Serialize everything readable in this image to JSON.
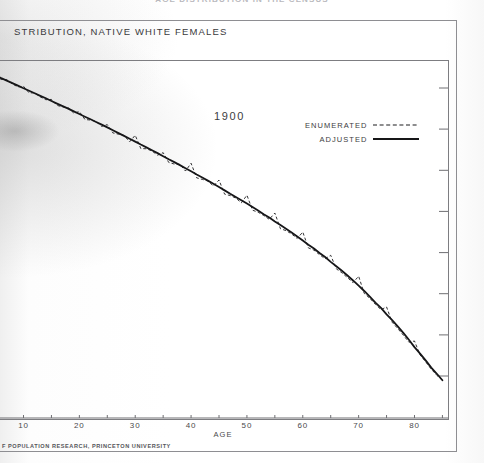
{
  "page": {
    "running_head": "AGE DISTRIBUTION IN THE CENSUS",
    "caption": "STRIBUTION, NATIVE WHITE FEMALES",
    "footer": "F POPULATION RESEARCH, PRINCETON UNIVERSITY"
  },
  "legend": {
    "position": "top-right",
    "items": [
      {
        "label": "ENUMERATED",
        "style": "dashed",
        "color": "#1d1d1f"
      },
      {
        "label": "ADJUSTED",
        "style": "solid",
        "color": "#161618"
      }
    ]
  },
  "chart_data": {
    "type": "line",
    "title": "1900",
    "xlabel": "AGE",
    "ylabel": "",
    "xlim": [
      4,
      86
    ],
    "ylim": [
      0,
      100
    ],
    "yscale": "log",
    "grid": false,
    "xticks": [
      10,
      20,
      30,
      40,
      50,
      60,
      70,
      80
    ],
    "xticks_minor": [
      5,
      15,
      25,
      35,
      45,
      55,
      65,
      75,
      85
    ],
    "yticks_unlabeled": 8,
    "x": [
      5,
      6,
      7,
      8,
      9,
      10,
      11,
      12,
      13,
      14,
      15,
      16,
      17,
      18,
      19,
      20,
      21,
      22,
      23,
      24,
      25,
      26,
      27,
      28,
      29,
      30,
      31,
      32,
      33,
      34,
      35,
      36,
      37,
      38,
      39,
      40,
      41,
      42,
      43,
      44,
      45,
      46,
      47,
      48,
      49,
      50,
      51,
      52,
      53,
      54,
      55,
      56,
      57,
      58,
      59,
      60,
      61,
      62,
      63,
      64,
      65,
      66,
      67,
      68,
      69,
      70,
      71,
      72,
      73,
      74,
      75,
      76,
      77,
      78,
      79,
      80,
      81,
      82,
      83,
      84,
      85
    ],
    "series": [
      {
        "name": "ADJUSTED",
        "style": "solid",
        "values": [
          92.4,
          90.3,
          88.5,
          86.6,
          84.8,
          83.0,
          81.3,
          79.6,
          77.9,
          76.3,
          74.6,
          73.0,
          71.5,
          70.0,
          68.4,
          66.9,
          65.4,
          64.0,
          62.6,
          61.2,
          59.8,
          58.4,
          57.0,
          55.7,
          54.4,
          53.1,
          51.8,
          50.6,
          49.4,
          48.2,
          47.0,
          45.8,
          44.7,
          43.6,
          42.5,
          41.4,
          40.3,
          39.3,
          38.3,
          37.3,
          36.3,
          35.3,
          34.3,
          33.4,
          32.5,
          31.6,
          30.7,
          29.8,
          28.9,
          28.1,
          27.2,
          26.4,
          25.6,
          24.8,
          24.0,
          23.2,
          22.4,
          21.7,
          20.9,
          20.2,
          19.4,
          18.7,
          18.0,
          17.3,
          16.6,
          15.9,
          15.2,
          14.5,
          13.8,
          13.2,
          12.5,
          11.9,
          11.3,
          10.7,
          10.1,
          9.5,
          9.0,
          8.5,
          8.0,
          7.6,
          7.2
        ]
      },
      {
        "name": "ENUMERATED",
        "style": "dashed",
        "values": [
          92.0,
          89.4,
          89.2,
          86.1,
          83.9,
          84.4,
          79.8,
          79.9,
          77.2,
          75.4,
          75.6,
          71.9,
          71.0,
          70.5,
          67.4,
          68.3,
          63.9,
          63.6,
          62.8,
          60.3,
          61.2,
          57.1,
          56.5,
          55.9,
          53.0,
          56.0,
          50.1,
          50.0,
          49.1,
          47.4,
          48.4,
          44.6,
          44.0,
          43.9,
          41.5,
          44.3,
          39.2,
          38.7,
          38.2,
          36.6,
          38.5,
          34.2,
          33.8,
          33.1,
          31.8,
          33.9,
          29.9,
          29.4,
          28.6,
          27.7,
          29.2,
          25.6,
          25.2,
          24.5,
          23.6,
          24.9,
          21.8,
          21.4,
          20.6,
          19.9,
          20.5,
          18.3,
          17.7,
          17.0,
          16.3,
          17.2,
          14.9,
          14.3,
          13.6,
          13.0,
          13.3,
          11.7,
          11.1,
          10.5,
          9.9,
          10.0,
          8.9,
          8.4,
          7.9,
          7.5,
          7.2
        ]
      }
    ]
  }
}
